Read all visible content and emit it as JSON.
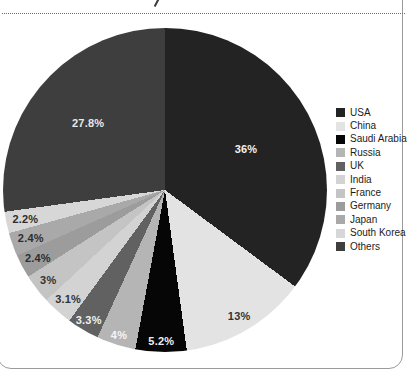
{
  "panel": {
    "border_color": "#9b9b9b",
    "separator_color": "#6e6e6e"
  },
  "chart_data": {
    "type": "pie",
    "title": "",
    "legend_position": "right",
    "categories": [
      "USA",
      "China",
      "Saudi Arabia",
      "Russia",
      "UK",
      "India",
      "France",
      "Germany",
      "Japan",
      "South Korea",
      "Others"
    ],
    "values": [
      36,
      13,
      5.2,
      4,
      3.3,
      3.1,
      3,
      2.4,
      2.4,
      2.2,
      27.8
    ],
    "slice_labels": [
      "36%",
      "13%",
      "5.2%",
      "4%",
      "3.3%",
      "3.1%",
      "3%",
      "2.4%",
      "2.4%",
      "2.2%",
      "27.8%"
    ],
    "colors": [
      "#232323",
      "#e3e3e3",
      "#060606",
      "#b5b5b5",
      "#616161",
      "#d3d3d3",
      "#c4c4c4",
      "#9c9c9c",
      "#a9a9a9",
      "#d7d7d7",
      "#3e3e3e"
    ],
    "label_colors": [
      "#f2f2f2",
      "#333333",
      "#eeeeee",
      "#f5f5f5",
      "#f0f0f0",
      "#333333",
      "#333333",
      "#2d2d2d",
      "#2d2d2d",
      "#2d2d2d",
      "#e8e8e8"
    ]
  }
}
